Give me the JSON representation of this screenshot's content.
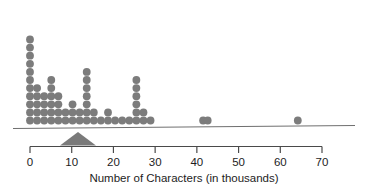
{
  "chart_data": {
    "type": "scatter",
    "plot_style": "dotplot",
    "title": "",
    "subtitle": "",
    "xlabel": "Number of Characters (in thousands)",
    "ylabel": "",
    "xlim": [
      0,
      70
    ],
    "ylim": [
      0,
      14
    ],
    "grid": false,
    "legend": null,
    "tick_labels": [
      "0",
      "10",
      "20",
      "30",
      "40",
      "50",
      "60",
      "70"
    ],
    "tick_values": [
      0,
      10,
      20,
      30,
      40,
      50,
      60,
      70
    ],
    "tick_interval": 10,
    "dot_color": "#7c7c7c",
    "axis_color": "#4a4a4a",
    "text_color": "#1d1d1d",
    "marker_color": "#7a7a7a",
    "marker_label": "balance-point-triangle",
    "marker_value": 11.5,
    "dot_diameter_units": 1.65,
    "n_observations": 72,
    "stacks": [
      {
        "x": 0.0,
        "count": 11
      },
      {
        "x": 1.7,
        "count": 5
      },
      {
        "x": 3.4,
        "count": 4
      },
      {
        "x": 5.1,
        "count": 6
      },
      {
        "x": 6.8,
        "count": 4
      },
      {
        "x": 8.5,
        "count": 2
      },
      {
        "x": 10.2,
        "count": 3
      },
      {
        "x": 11.9,
        "count": 2
      },
      {
        "x": 13.6,
        "count": 7
      },
      {
        "x": 15.3,
        "count": 2
      },
      {
        "x": 17.0,
        "count": 1
      },
      {
        "x": 18.7,
        "count": 2
      },
      {
        "x": 20.4,
        "count": 1
      },
      {
        "x": 22.1,
        "count": 1
      },
      {
        "x": 23.8,
        "count": 1
      },
      {
        "x": 25.5,
        "count": 6
      },
      {
        "x": 27.2,
        "count": 2
      },
      {
        "x": 28.9,
        "count": 1
      },
      {
        "x": 41.5,
        "count": 1
      },
      {
        "x": 42.6,
        "count": 1
      },
      {
        "x": 64.2,
        "count": 1
      }
    ],
    "values": [
      0,
      0,
      0,
      0,
      0,
      0,
      0,
      0,
      0,
      0,
      0,
      1.7,
      1.7,
      1.7,
      1.7,
      1.7,
      3.4,
      3.4,
      3.4,
      3.4,
      5.1,
      5.1,
      5.1,
      5.1,
      5.1,
      5.1,
      6.8,
      6.8,
      6.8,
      6.8,
      8.5,
      8.5,
      10.2,
      10.2,
      10.2,
      11.9,
      11.9,
      13.6,
      13.6,
      13.6,
      13.6,
      13.6,
      13.6,
      13.6,
      15.3,
      15.3,
      17.0,
      18.7,
      18.7,
      20.4,
      22.1,
      23.8,
      25.5,
      25.5,
      25.5,
      25.5,
      25.5,
      25.5,
      27.2,
      27.2,
      28.9,
      41.5,
      42.6,
      64.2
    ]
  },
  "axis": {
    "label": "Number of Characters (in thousands)",
    "ticks": [
      {
        "label": "0",
        "value": 0
      },
      {
        "label": "10",
        "value": 10
      },
      {
        "label": "20",
        "value": 20
      },
      {
        "label": "30",
        "value": 30
      },
      {
        "label": "40",
        "value": 40
      },
      {
        "label": "50",
        "value": 50
      },
      {
        "label": "60",
        "value": 60
      },
      {
        "label": "70",
        "value": 70
      }
    ]
  }
}
